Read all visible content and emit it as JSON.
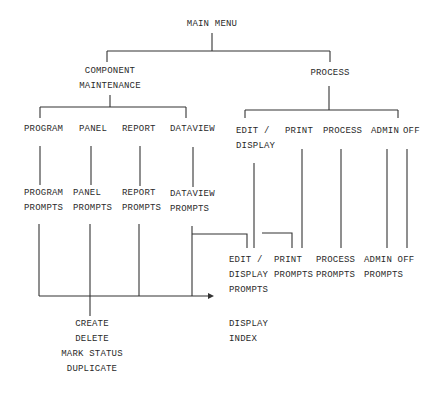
{
  "diagram": {
    "title": "MAIN MENU",
    "level1": [
      {
        "label": "COMPONENT\nMAINTENANCE"
      },
      {
        "label": "PROCESS"
      }
    ],
    "component_children": [
      {
        "label": "PROGRAM",
        "prompts": "PROGRAM\nPROMPTS"
      },
      {
        "label": "PANEL",
        "prompts": "PANEL\nPROMPTS"
      },
      {
        "label": "REPORT",
        "prompts": "REPORT\nPROMPTS"
      },
      {
        "label": "DATAVIEW",
        "prompts": "DATAVIEW\nPROMPTS"
      }
    ],
    "process_children": [
      {
        "label": "EDIT /\nDISPLAY"
      },
      {
        "label": "PRINT"
      },
      {
        "label": "PROCESS"
      },
      {
        "label": "ADMIN"
      },
      {
        "label": "OFF"
      }
    ],
    "process_prompts": [
      {
        "label": "EDIT /\nDISPLAY\nPROMPTS"
      },
      {
        "label": "PRINT\nPROMPTS"
      },
      {
        "label": "PROCESS\nPROMPTS"
      },
      {
        "label": "ADMIN OFF\nPROMPTS"
      }
    ],
    "panel_actions": "CREATE\nDELETE\nMARK STATUS\nDUPLICATE",
    "display_index": "DISPLAY\nINDEX"
  }
}
